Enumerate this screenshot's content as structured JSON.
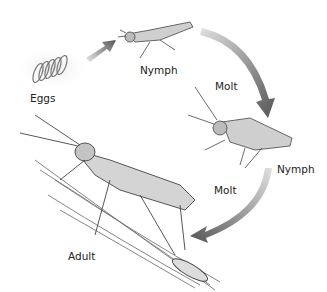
{
  "diagram": {
    "stages": [
      {
        "id": "eggs",
        "label": "Eggs"
      },
      {
        "id": "nymph1",
        "label": "Nymph"
      },
      {
        "id": "nymph2",
        "label": "Nymph"
      },
      {
        "id": "adult",
        "label": "Adult"
      }
    ],
    "transitions": [
      {
        "from": "eggs",
        "to": "nymph1",
        "label": ""
      },
      {
        "from": "nymph1",
        "to": "nymph2",
        "label": "Molt"
      },
      {
        "from": "nymph2",
        "to": "adult",
        "label": "Molt"
      }
    ],
    "colors": {
      "arrow_dark": "#555555",
      "arrow_light": "#d8d8d8",
      "ink": "#333333",
      "text": "#222222",
      "background": "#ffffff"
    }
  }
}
